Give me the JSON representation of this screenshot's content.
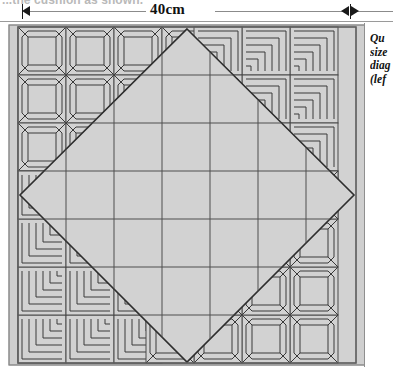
{
  "page": {
    "width": 393,
    "height": 367,
    "background": "#ffffff"
  },
  "bleed_text": "...the cushion as shown.",
  "dimension": {
    "label": "40cm",
    "left_arrow_icon": "arrow-right-icon",
    "right_arrow_icon": "arrow-left-right-icon",
    "tick_icon": "tick-mark-icon"
  },
  "caption": {
    "lines": [
      "Qu",
      "size",
      "diag",
      "(lef"
    ]
  },
  "diagram": {
    "fill_color": "#d2d2d2",
    "line_color": "#3a3a3a",
    "grid_color": "#555555",
    "border_color": "#7a7a7a",
    "grid_columns": 7,
    "grid_rows": 7,
    "blocks": {
      "top_left": "square-in-square-star-block",
      "top_right": "log-cabin-spiral-block",
      "bottom_left": "log-cabin-spiral-block",
      "bottom_right": "square-in-square-star-block",
      "center": "plain-grid-diamond"
    }
  }
}
